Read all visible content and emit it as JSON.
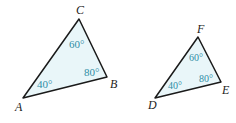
{
  "colors": {
    "fill": "#e9f6f9",
    "stroke": "#1a1a1a",
    "angle_label": "#2f8ea6",
    "vertex_label": "#222222"
  },
  "triangles": [
    {
      "name": "ABC",
      "vertices": {
        "A": "A",
        "B": "B",
        "C": "C"
      },
      "angles": {
        "A": "40°",
        "B": "80°",
        "C": "60°"
      }
    },
    {
      "name": "DEF",
      "vertices": {
        "D": "D",
        "E": "E",
        "F": "F"
      },
      "angles": {
        "D": "40°",
        "E": "80°",
        "F": "60°"
      }
    }
  ]
}
